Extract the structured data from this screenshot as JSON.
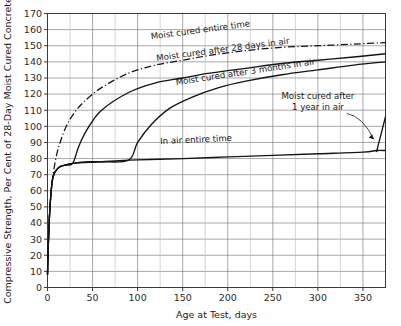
{
  "chart_data": {
    "type": "line",
    "title": "",
    "xlabel": "Age at Test, days",
    "ylabel": "Compressive Strength, Per Cent of 28-Day Moist Cured Concrete",
    "xlim": [
      0,
      375
    ],
    "ylim": [
      0,
      170
    ],
    "xticks": [
      0,
      50,
      100,
      150,
      200,
      250,
      300,
      350
    ],
    "yticks": [
      0,
      10,
      20,
      30,
      40,
      50,
      60,
      70,
      80,
      90,
      100,
      110,
      120,
      130,
      140,
      150,
      160,
      170
    ],
    "xtick_labels": [
      "0",
      "50",
      "100",
      "150",
      "200",
      "250",
      "300",
      "350"
    ],
    "ytick_labels": [
      "0",
      "10",
      "20",
      "30",
      "40",
      "50",
      "60",
      "70",
      "80",
      "90",
      "100",
      "110",
      "120",
      "130",
      "140",
      "150",
      "160",
      "170"
    ],
    "grid": true,
    "grid_minor_step_x": 25,
    "grid_major_step_x": 50,
    "legend": "inline-annotations",
    "series": [
      {
        "name": "Moist cured entire time",
        "style": "dash-dot",
        "x": [
          0,
          1,
          2,
          3,
          5,
          7,
          10,
          14,
          20,
          28,
          40,
          60,
          90,
          120,
          150,
          180,
          220,
          260,
          300,
          340,
          375
        ],
        "y": [
          8,
          28,
          42,
          52,
          65,
          73,
          82,
          90,
          99,
          107,
          115,
          124,
          133,
          138,
          141,
          144,
          147,
          149,
          150,
          151,
          152
        ]
      },
      {
        "name": "Moist cured after 28 days in air",
        "style": "solid",
        "x": [
          0,
          1,
          2,
          3,
          5,
          7,
          10,
          14,
          20,
          28,
          35,
          45,
          60,
          90,
          120,
          150,
          180,
          220,
          260,
          300,
          340,
          375
        ],
        "y": [
          8,
          28,
          42,
          52,
          65,
          70,
          73,
          75,
          76,
          77,
          88,
          99,
          110,
          121,
          127,
          130,
          133,
          136,
          139,
          141,
          143,
          145
        ]
      },
      {
        "name": "Moist cured after 3 months in air",
        "style": "solid",
        "x": [
          0,
          1,
          2,
          3,
          5,
          7,
          10,
          14,
          20,
          28,
          45,
          60,
          90,
          100,
          115,
          135,
          160,
          190,
          220,
          260,
          300,
          340,
          375
        ],
        "y": [
          8,
          28,
          42,
          52,
          65,
          70,
          73,
          75,
          76,
          77,
          78,
          78,
          79,
          90,
          101,
          111,
          118,
          124,
          128,
          132,
          135,
          138,
          140
        ]
      },
      {
        "name": "In air entire time",
        "style": "solid",
        "x": [
          0,
          1,
          2,
          3,
          5,
          7,
          10,
          14,
          20,
          28,
          60,
          90,
          150,
          200,
          250,
          300,
          350,
          365,
          375
        ],
        "y": [
          8,
          28,
          42,
          52,
          65,
          70,
          73,
          75,
          76,
          77,
          78,
          79,
          80,
          81,
          82,
          83,
          84,
          85,
          85
        ]
      },
      {
        "name": "Moist cured after 1 year in air",
        "style": "solid",
        "x": [
          365,
          370,
          375
        ],
        "y": [
          84,
          95,
          106
        ]
      }
    ],
    "annotations": [
      {
        "text": "Moist cured entire time",
        "x": 170,
        "y": 158
      },
      {
        "text": "Moist cured after 28 days in air",
        "x": 195,
        "y": 146
      },
      {
        "text": "Moist cured after 3 months in air",
        "x": 220,
        "y": 132
      },
      {
        "text": "Moist cured after",
        "x": 300,
        "y": 117
      },
      {
        "text": "1 year in air",
        "x": 300,
        "y": 110
      },
      {
        "text": "In air entire time",
        "x": 165,
        "y": 90
      }
    ]
  },
  "axes": {
    "y_title": "Compressive Strength, Per Cent of 28-Day Moist Cured Concrete",
    "x_title": "Age at Test, days"
  },
  "labels": {
    "moist_entire": "Moist cured entire time",
    "moist_28days": "Moist cured after 28 days in air",
    "moist_3months": "Moist cured after 3 months in air",
    "moist_1year_line1": "Moist cured after",
    "moist_1year_line2": "1 year in air",
    "in_air_entire": "In air entire time"
  },
  "ticks": {
    "x": [
      "0",
      "50",
      "100",
      "150",
      "200",
      "250",
      "300",
      "350"
    ],
    "y": [
      "0",
      "10",
      "20",
      "30",
      "40",
      "50",
      "60",
      "70",
      "80",
      "90",
      "100",
      "110",
      "120",
      "130",
      "140",
      "150",
      "160",
      "170"
    ]
  }
}
